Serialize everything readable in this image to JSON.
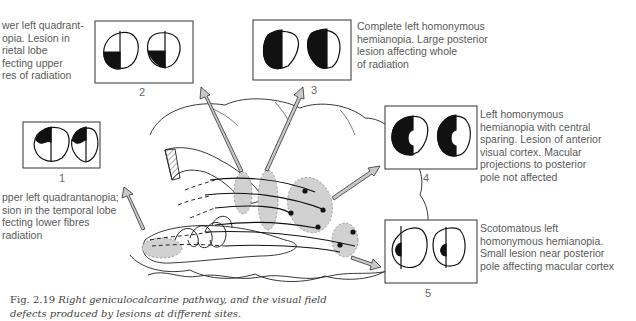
{
  "figure": {
    "number": "Fig. 2.19",
    "caption_line1": "Right geniculocalcarine pathway, and the visual field",
    "caption_line2": "defects produced by lesions at different sites."
  },
  "panels": [
    {
      "id": "1",
      "label": "1",
      "description": "Upper left quadrantanopia; lesion in the temporal lobe affecting lower fibres of radiation",
      "visible_text": "pper left quadrantanopia;\nsion in the temporal lobe\nfecting lower fibres\nradiation",
      "defect": "upper-left-quadrant"
    },
    {
      "id": "2",
      "label": "2",
      "description": "Lower left quadrantanopia. Lesion in parietal lobe affecting upper fibres of radiation",
      "visible_text": "wer left quadrant-\nopia. Lesion in\nrietal lobe\nfecting upper\nres of radiation",
      "defect": "lower-left-quadrant"
    },
    {
      "id": "3",
      "label": "3",
      "description": "Complete left homonymous hemianopia. Large posterior lesion affecting whole of radiation",
      "visible_text": "Complete left homonymous\nhemianopia. Large posterior\nlesion affecting whole\nof radiation",
      "defect": "left-half"
    },
    {
      "id": "4",
      "label": "4",
      "description": "Left homonymous hemianopia with central sparing. Lesion of anterior visual cortex. Macular projections to posterior pole not affected",
      "visible_text": "Left homonymous\nhemianopia with central\nsparing. Lesion of anterior\nvisual cortex. Macular\nprojections to posterior\npole not affected",
      "defect": "left-half-macular-sparing"
    },
    {
      "id": "5",
      "label": "5",
      "description": "Scotomatous left homonymous hemianopia. Small lesion near posterior pole affecting macular cortex",
      "visible_text": "Scotomatous left\nhomonymous hemianopia.\nSmall lesion near posterior\npole affecting macular cortex",
      "defect": "left-central-scotoma"
    }
  ],
  "colors": {
    "ink": "#111111",
    "lesion_fill": "#cfcfcf",
    "arrow_fill": "#c8c8c8",
    "text": "#5a5a5a"
  }
}
